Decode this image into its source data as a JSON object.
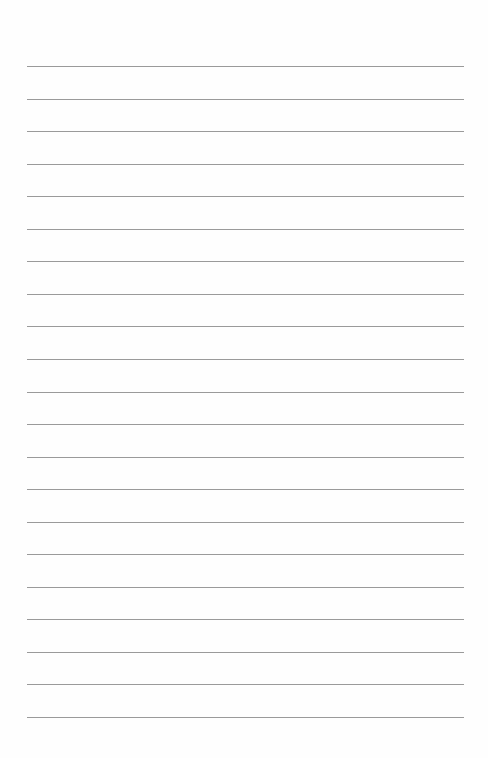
{
  "page": {
    "type": "blank lined paper",
    "line_count": 21,
    "first_line_y": 66,
    "line_spacing": 32.55,
    "line_left": 27,
    "line_width": 437,
    "line_color": "#9a9a9a",
    "background_color": "#fefefe"
  }
}
